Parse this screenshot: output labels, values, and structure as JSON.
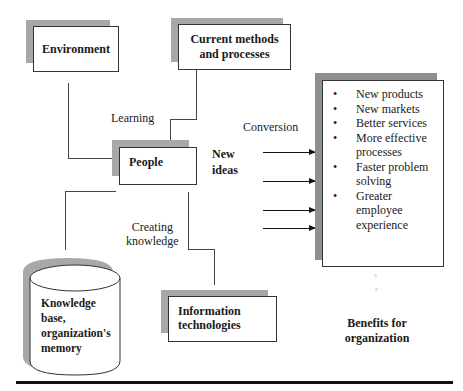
{
  "nodes": {
    "environment": "Environment",
    "current_methods": [
      "Current methods",
      "and processes"
    ],
    "people": "People",
    "new_ideas": [
      "New",
      "ideas"
    ],
    "knowledge_base": [
      "Knowledge",
      "base,",
      "organization's",
      "memory"
    ],
    "information_technologies": [
      "Information",
      "technologies"
    ],
    "benefits_title": [
      "Benefits for",
      "organization"
    ]
  },
  "edge_labels": {
    "learning": "Learning",
    "conversion": "Conversion",
    "creating_knowledge": [
      "Creating",
      "knowledge"
    ]
  },
  "benefits": [
    [
      "New products"
    ],
    [
      "New markets"
    ],
    [
      "Better services"
    ],
    [
      "More effective",
      "processes"
    ],
    [
      "Faster problem",
      "solving"
    ],
    [
      "Greater",
      "employee",
      "experience"
    ]
  ],
  "colors": {
    "shadow": "#a8a8a8",
    "border": "#333333",
    "text": "#1a1a1a"
  }
}
